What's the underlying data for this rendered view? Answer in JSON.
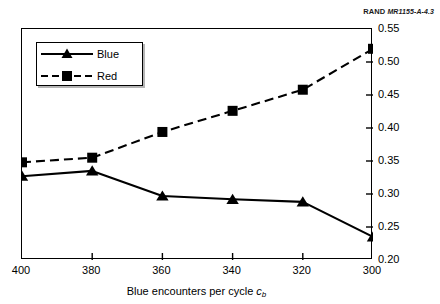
{
  "credit": {
    "organization": "RAND",
    "document_id": "MR1155-A-4.3"
  },
  "legend": {
    "position": "upper-left",
    "entries": [
      {
        "label": "Blue",
        "marker": "triangle",
        "line": "solid"
      },
      {
        "label": "Red",
        "marker": "square",
        "line": "dashed"
      }
    ]
  },
  "axes": {
    "x_label_prefix": "Blue encounters per cycle ",
    "x_label_symbol": "c",
    "x_label_subscript": "b",
    "y_label_prefix": "Fraction surviving at ",
    "y_label_symbol": "t",
    "y_label_suffix": " = 5",
    "x_ticks": [
      "400",
      "380",
      "360",
      "340",
      "320",
      "300"
    ],
    "y_ticks": [
      "0.20",
      "0.25",
      "0.30",
      "0.35",
      "0.40",
      "0.45",
      "0.50",
      "0.55"
    ]
  },
  "chart_data": {
    "type": "line",
    "title": "",
    "xlabel": "Blue encounters per cycle c_b",
    "ylabel": "Fraction surviving at t = 5",
    "x": [
      400,
      380,
      360,
      340,
      320,
      300
    ],
    "xlim": [
      400,
      300
    ],
    "ylim": [
      0.2,
      0.55
    ],
    "x_reversed": true,
    "grid": false,
    "legend_position": "upper-left",
    "y_axis_side": "right",
    "series": [
      {
        "name": "Blue",
        "values": [
          0.327,
          0.335,
          0.297,
          0.292,
          0.288,
          0.235
        ],
        "marker": "triangle",
        "linestyle": "solid",
        "color": "#000000"
      },
      {
        "name": "Red",
        "values": [
          0.348,
          0.355,
          0.394,
          0.426,
          0.458,
          0.52
        ],
        "marker": "square",
        "linestyle": "dashed",
        "color": "#000000"
      }
    ]
  }
}
